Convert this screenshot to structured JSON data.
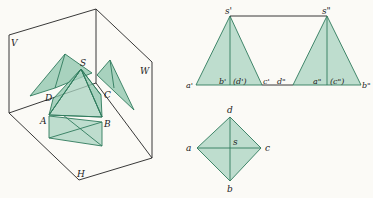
{
  "figure": {
    "colors": {
      "fill": "#a9d3c0",
      "edge": "#2f7a5c",
      "frame": "#222222",
      "background": "#fbfaf6"
    }
  },
  "pictorial": {
    "planes": {
      "v": "V",
      "w": "W",
      "h": "H"
    },
    "vertices": {
      "s": "S",
      "a": "A",
      "b": "B",
      "c": "C",
      "d": "D"
    }
  },
  "front_view": {
    "apex": "s'",
    "base_labels": {
      "a": "a'",
      "b": "b'",
      "d": "(d')",
      "c": "c'"
    }
  },
  "side_view": {
    "apex": "s\"",
    "base_labels": {
      "d": "d\"",
      "a": "a\"",
      "c": "(c\")",
      "b": "b\""
    }
  },
  "top_view": {
    "labels": {
      "d": "d",
      "a": "a",
      "s": "s",
      "c": "c",
      "b": "b"
    }
  }
}
